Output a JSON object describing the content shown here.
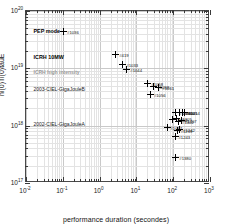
{
  "chart_data": {
    "type": "scatter",
    "title": "",
    "xlabel": "performance duration (secondes)",
    "ylabel": "ni(0)Ti(0)tauE",
    "xscale": "log",
    "yscale": "log",
    "xlim": [
      0.01,
      1000
    ],
    "ylim": [
      1e+17,
      1e+20
    ],
    "grid": true,
    "legend": "none",
    "xticks": [
      {
        "value": 0.01,
        "label": "10",
        "exp": "-2"
      },
      {
        "value": 0.1,
        "label": "10",
        "exp": "-1"
      },
      {
        "value": 1,
        "label": "10",
        "exp": "0"
      },
      {
        "value": 10,
        "label": "10",
        "exp": "1"
      },
      {
        "value": 100,
        "label": "10",
        "exp": "2"
      },
      {
        "value": 1000,
        "label": "10",
        "exp": "3"
      }
    ],
    "yticks": [
      {
        "value": 1e+17,
        "label": "10",
        "exp": "17"
      },
      {
        "value": 1e+18,
        "label": "10",
        "exp": "18"
      },
      {
        "value": 1e+19,
        "label": "10",
        "exp": "19"
      },
      {
        "value": 1e+20,
        "label": "10",
        "exp": "20"
      }
    ],
    "annotations": [
      {
        "text": "PEP mode",
        "x": 0.016,
        "y": 4.4e+19,
        "style": "bold"
      },
      {
        "text": "ICRH 10MW",
        "x": 0.016,
        "y": 1.55e+19,
        "style": "bold"
      },
      {
        "text": "ICRH high intensity",
        "x": 0.016,
        "y": 8.6e+18,
        "style": "grey"
      },
      {
        "text": "2003-CIEL-GigaJouleB",
        "x": 0.016,
        "y": 4.3e+18,
        "style": "normal"
      },
      {
        "text": "2002-CIEL-GigaJouleA",
        "x": 0.016,
        "y": 1.08e+18,
        "style": "normal"
      }
    ],
    "points": [
      {
        "label": "#1036",
        "x": 0.105,
        "y": 4.45e+19
      },
      {
        "label": "#419",
        "x": 2.75,
        "y": 1.72e+19
      },
      {
        "label": "#1033",
        "x": 4.3,
        "y": 1.17e+19
      },
      {
        "label": "#1044",
        "x": 5.5,
        "y": 9.6e+18
      },
      {
        "label": "#1058",
        "x": 20.5,
        "y": 5.4e+18
      },
      {
        "label": "#1059",
        "x": 30.0,
        "y": 4.8e+18
      },
      {
        "label": "#1061",
        "x": 41.0,
        "y": 4.7e+18
      },
      {
        "label": "#1056",
        "x": 24.0,
        "y": 3.5e+18
      },
      {
        "label": "#1414",
        "x": 205.0,
        "y": 1.72e+18
      },
      {
        "label": "#1398",
        "x": 118.0,
        "y": 1.7e+18
      },
      {
        "label": "#1400",
        "x": 148.0,
        "y": 1.71e+18
      },
      {
        "label": "#1405",
        "x": 176.0,
        "y": 1.73e+18
      },
      {
        "label": "#1110",
        "x": 98.0,
        "y": 1.29e+18
      },
      {
        "label": "#1305",
        "x": 124.0,
        "y": 1.31e+18
      },
      {
        "label": "#1407",
        "x": 168.0,
        "y": 1.22e+18
      },
      {
        "label": "#1402",
        "x": 140.0,
        "y": 1.2e+18
      },
      {
        "label": "#1057",
        "x": 68.0,
        "y": 9.3e+17
      },
      {
        "label": "#1239",
        "x": 128.0,
        "y": 8.3e+17
      },
      {
        "label": "#1242",
        "x": 150.0,
        "y": 8.5e+17
      },
      {
        "label": "#1243",
        "x": 112.0,
        "y": 6.6e+17
      },
      {
        "label": "#1380",
        "x": 118.0,
        "y": 2.75e+17
      }
    ]
  }
}
